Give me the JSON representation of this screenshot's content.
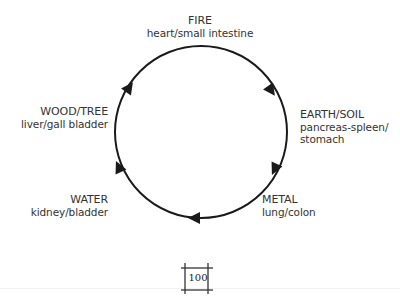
{
  "diagram": {
    "direction": "clockwise",
    "elements": [
      {
        "element": "FIRE",
        "organs": "heart/small intestine"
      },
      {
        "element": "EARTH/SOIL",
        "organs_line1": "pancreas-spleen/",
        "organs_line2": "stomach"
      },
      {
        "element": "METAL",
        "organs": "lung/colon"
      },
      {
        "element": "WATER",
        "organs": "kidney/bladder"
      },
      {
        "element": "WOOD/TREE",
        "organs": "liver/gall bladder"
      }
    ],
    "colors": {
      "stroke": "#1a1a1a",
      "text": "#333333"
    }
  },
  "footer": {
    "page_number": "100"
  }
}
